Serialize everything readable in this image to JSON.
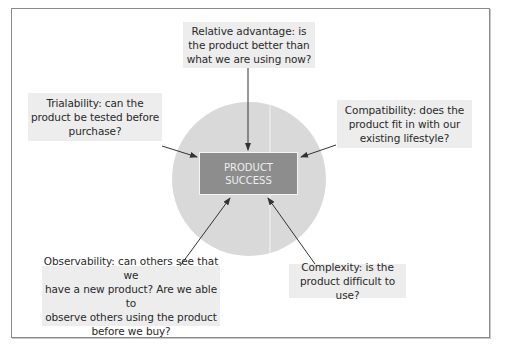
{
  "diagram": {
    "center": {
      "label_line1": "PRODUCT",
      "label_line2": "SUCCESS"
    },
    "factors": [
      {
        "id": "relative-advantage",
        "line1": "Relative advantage: is",
        "line2": "the product better than",
        "line3": "what we are using now?"
      },
      {
        "id": "trialability",
        "line1": "Trialability: can the",
        "line2": "product be tested before",
        "line3": "purchase?"
      },
      {
        "id": "compatibility",
        "line1": "Compatibility: does the",
        "line2": "product fit in with our",
        "line3": "existing lifestyle?"
      },
      {
        "id": "observability",
        "line1": "Observability: can others see that we",
        "line2": "have a new product? Are we able to",
        "line3": "observe others using the product",
        "line4": "before we buy?"
      },
      {
        "id": "complexity",
        "line1": "Complexity: is the",
        "line2": "product difficult to use?"
      }
    ],
    "colors": {
      "circle": "#d9d9d9",
      "center_box": "#8d8d8d",
      "factor_box": "#ededed",
      "arrow": "#333333",
      "frame": "#8a8a8a"
    }
  }
}
